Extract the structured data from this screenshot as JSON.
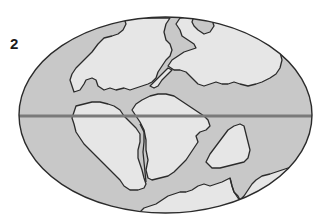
{
  "figure": {
    "panel_label": "2",
    "colors": {
      "background": "#ffffff",
      "ocean": "#c8c8c8",
      "land": "#e6e6e6",
      "outline": "#2b2b2b",
      "equator": "#7a7a7a"
    },
    "elements": {
      "globe": "ellipse",
      "equator": "horizontal line",
      "landmasses": [
        "north-west-continent",
        "north-central-continent",
        "north-east-continent",
        "south-west-continent",
        "south-central-continent",
        "south-east-island",
        "south-bottom-continent"
      ]
    }
  }
}
